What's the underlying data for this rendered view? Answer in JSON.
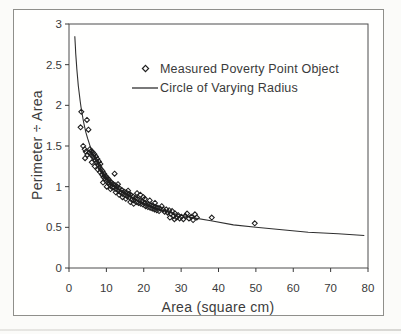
{
  "figure": {
    "background": "#fffffe",
    "border_color": "#8f8f8b",
    "ink_color": "#3a3a3a",
    "marker_color": "#1f1f1f",
    "curve_color": "#303030"
  },
  "chart_data": {
    "type": "scatter",
    "title": "",
    "xlabel": "Area (square cm)",
    "ylabel": "Perimeter ÷ Area",
    "xlim": [
      0,
      80
    ],
    "ylim": [
      0,
      3
    ],
    "xticks": [
      0,
      10,
      20,
      30,
      40,
      50,
      60,
      70,
      80
    ],
    "xtick_labels": [
      "0",
      "10",
      "20",
      "30",
      "40",
      "50",
      "60",
      "70",
      "80"
    ],
    "yticks": [
      0,
      0.5,
      1,
      1.5,
      2,
      2.5,
      3
    ],
    "ytick_labels": [
      "0",
      "0.5",
      "1",
      "1.5",
      "2",
      "2.5",
      "3"
    ],
    "grid": false,
    "legend_position": "inside upper middle",
    "series": [
      {
        "name": "Measured Poverty Point Object",
        "type": "scatter",
        "marker": "open-diamond",
        "points": [
          [
            3.3,
            1.92
          ],
          [
            4.8,
            1.82
          ],
          [
            3.1,
            1.73
          ],
          [
            5.2,
            1.7
          ],
          [
            3.8,
            1.5
          ],
          [
            4.2,
            1.46
          ],
          [
            4.5,
            1.43
          ],
          [
            4.9,
            1.39
          ],
          [
            4.3,
            1.35
          ],
          [
            5.4,
            1.42
          ],
          [
            5.6,
            1.46
          ],
          [
            5.8,
            1.4
          ],
          [
            6.0,
            1.44
          ],
          [
            6.2,
            1.38
          ],
          [
            6.4,
            1.42
          ],
          [
            6.6,
            1.36
          ],
          [
            6.8,
            1.4
          ],
          [
            7.0,
            1.33
          ],
          [
            7.2,
            1.37
          ],
          [
            7.4,
            1.3
          ],
          [
            7.6,
            1.34
          ],
          [
            7.8,
            1.27
          ],
          [
            8.0,
            1.31
          ],
          [
            8.2,
            1.24
          ],
          [
            8.4,
            1.28
          ],
          [
            6.1,
            1.3
          ],
          [
            6.9,
            1.25
          ],
          [
            7.7,
            1.21
          ],
          [
            8.3,
            1.18
          ],
          [
            8.6,
            1.21
          ],
          [
            8.8,
            1.15
          ],
          [
            9.0,
            1.19
          ],
          [
            9.2,
            1.12
          ],
          [
            9.4,
            1.16
          ],
          [
            9.6,
            1.1
          ],
          [
            9.8,
            1.13
          ],
          [
            10.0,
            1.07
          ],
          [
            10.2,
            1.11
          ],
          [
            10.4,
            1.05
          ],
          [
            10.6,
            1.09
          ],
          [
            10.8,
            1.03
          ],
          [
            11.0,
            1.06
          ],
          [
            11.2,
            1.01
          ],
          [
            11.4,
            1.05
          ],
          [
            11.6,
            0.99
          ],
          [
            11.8,
            1.03
          ],
          [
            9.1,
            1.05
          ],
          [
            10.1,
            1.0
          ],
          [
            11.1,
            0.97
          ],
          [
            12.2,
            1.16
          ],
          [
            13.1,
            1.03
          ],
          [
            12.0,
            0.99
          ],
          [
            12.3,
            1.02
          ],
          [
            12.6,
            0.97
          ],
          [
            12.9,
            1.0
          ],
          [
            13.2,
            0.95
          ],
          [
            13.5,
            0.98
          ],
          [
            13.8,
            0.93
          ],
          [
            14.1,
            0.96
          ],
          [
            14.4,
            0.91
          ],
          [
            14.7,
            0.94
          ],
          [
            15.0,
            0.9
          ],
          [
            15.3,
            0.93
          ],
          [
            15.6,
            0.88
          ],
          [
            15.9,
            0.91
          ],
          [
            12.5,
            0.93
          ],
          [
            13.4,
            0.9
          ],
          [
            14.3,
            0.87
          ],
          [
            15.2,
            0.85
          ],
          [
            15.8,
            0.95
          ],
          [
            16.2,
            0.87
          ],
          [
            16.5,
            0.9
          ],
          [
            16.8,
            0.84
          ],
          [
            17.1,
            0.88
          ],
          [
            17.4,
            0.83
          ],
          [
            17.7,
            0.86
          ],
          [
            18.0,
            0.81
          ],
          [
            18.3,
            0.85
          ],
          [
            18.6,
            0.8
          ],
          [
            18.9,
            0.83
          ],
          [
            19.2,
            0.79
          ],
          [
            19.5,
            0.82
          ],
          [
            19.8,
            0.78
          ],
          [
            16.4,
            0.81
          ],
          [
            17.3,
            0.79
          ],
          [
            18.2,
            0.92
          ],
          [
            19.1,
            0.9
          ],
          [
            19.9,
            0.87
          ],
          [
            20.2,
            0.8
          ],
          [
            20.5,
            0.76
          ],
          [
            20.8,
            0.79
          ],
          [
            21.1,
            0.75
          ],
          [
            21.4,
            0.78
          ],
          [
            21.7,
            0.74
          ],
          [
            22.0,
            0.77
          ],
          [
            22.3,
            0.73
          ],
          [
            22.6,
            0.76
          ],
          [
            22.9,
            0.72
          ],
          [
            23.2,
            0.75
          ],
          [
            23.5,
            0.71
          ],
          [
            23.8,
            0.74
          ],
          [
            24.1,
            0.7
          ],
          [
            24.4,
            0.73
          ],
          [
            24.8,
            0.76
          ],
          [
            20.3,
            0.85
          ],
          [
            21.6,
            0.83
          ],
          [
            23.0,
            0.8
          ],
          [
            25.2,
            0.72
          ],
          [
            25.6,
            0.69
          ],
          [
            26.0,
            0.72
          ],
          [
            26.4,
            0.68
          ],
          [
            26.8,
            0.71
          ],
          [
            27.2,
            0.67
          ],
          [
            27.6,
            0.7
          ],
          [
            28.0,
            0.64
          ],
          [
            28.4,
            0.67
          ],
          [
            28.8,
            0.62
          ],
          [
            29.2,
            0.65
          ],
          [
            29.6,
            0.61
          ],
          [
            27.0,
            0.62
          ],
          [
            28.2,
            0.6
          ],
          [
            30.1,
            0.63
          ],
          [
            30.6,
            0.6
          ],
          [
            31.1,
            0.64
          ],
          [
            31.6,
            0.67
          ],
          [
            32.1,
            0.61
          ],
          [
            32.7,
            0.63
          ],
          [
            33.2,
            0.59
          ],
          [
            33.7,
            0.66
          ],
          [
            34.2,
            0.62
          ],
          [
            38.2,
            0.62
          ],
          [
            49.7,
            0.55
          ]
        ]
      },
      {
        "name": "Circle of Varying Radius",
        "type": "line",
        "marker": "solid-line",
        "points": [
          [
            1.55,
            2.85
          ],
          [
            1.7,
            2.72
          ],
          [
            1.8,
            2.64
          ],
          [
            1.95,
            2.54
          ],
          [
            2.1,
            2.45
          ],
          [
            2.3,
            2.34
          ],
          [
            2.5,
            2.24
          ],
          [
            2.7,
            2.16
          ],
          [
            3.0,
            2.05
          ],
          [
            3.2,
            1.98
          ],
          [
            3.5,
            1.9
          ],
          [
            3.8,
            1.82
          ],
          [
            4.0,
            1.77
          ],
          [
            4.5,
            1.67
          ],
          [
            5.0,
            1.59
          ],
          [
            6.0,
            1.45
          ],
          [
            7.0,
            1.34
          ],
          [
            8.0,
            1.25
          ],
          [
            10,
            1.12
          ],
          [
            12,
            1.02
          ],
          [
            14,
            0.95
          ],
          [
            17,
            0.86
          ],
          [
            20,
            0.79
          ],
          [
            24,
            0.72
          ],
          [
            28,
            0.67
          ],
          [
            33,
            0.62
          ],
          [
            38,
            0.58
          ],
          [
            44,
            0.53
          ],
          [
            50,
            0.5
          ],
          [
            57,
            0.47
          ],
          [
            64,
            0.44
          ],
          [
            72,
            0.42
          ],
          [
            79,
            0.4
          ]
        ]
      }
    ]
  }
}
